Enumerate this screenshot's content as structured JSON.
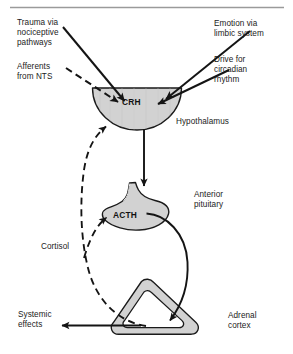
{
  "figure": {
    "type": "biological-pathway-diagram",
    "colors": {
      "organ_fill": "#d2d2d2",
      "organ_stroke": "#1a1a1a",
      "text": "#1b1b1b",
      "rule": "#9a9a9a",
      "background": "#ffffff"
    }
  },
  "rule": {
    "name": "top-divider"
  },
  "labels": {
    "trauma": "Trauma via\nnociceptive\npathways",
    "afferents": "Afferents\nfrom NTS",
    "emotion": "Emotion via\nlimbic system",
    "circadian": "Drive for\ncircadian\nrhythm",
    "hypothalamus": "Hypothalamus",
    "anterior_pituitary": "Anterior\npituitary",
    "cortisol": "Cortisol",
    "systemic_effects": "Systemic\neffects",
    "adrenal_cortex": "Adrenal\ncortex"
  },
  "organs": [
    {
      "id": "hypothalamus",
      "label": "Hypothalamus",
      "hormone": "CRH",
      "shape": "semicircle"
    },
    {
      "id": "anterior-pituitary",
      "label": "Anterior pituitary",
      "hormone": "ACTH",
      "shape": "pituitary-lobe"
    },
    {
      "id": "adrenal-cortex",
      "label": "Adrenal cortex",
      "hormone": "Cortisol",
      "shape": "rounded-triangle-ring"
    }
  ],
  "hormones": {
    "crh": "CRH",
    "acth": "ACTH",
    "cortisol": "Cortisol"
  },
  "arrows": [
    {
      "id": "trauma-to-crh",
      "style": "solid",
      "from": "Trauma via nociceptive pathways",
      "to": "CRH"
    },
    {
      "id": "afferents-to-crh",
      "style": "dashed",
      "from": "Afferents from NTS",
      "to": "CRH"
    },
    {
      "id": "emotion-to-crh",
      "style": "solid",
      "from": "Emotion via limbic system",
      "to": "CRH"
    },
    {
      "id": "circadian-to-crh",
      "style": "solid",
      "from": "Drive for circadian rhythm",
      "to": "CRH"
    },
    {
      "id": "crh-to-acth",
      "style": "solid",
      "from": "CRH",
      "to": "ACTH"
    },
    {
      "id": "acth-to-adrenal",
      "style": "solid",
      "from": "ACTH",
      "to": "Adrenal cortex"
    },
    {
      "id": "cortisol-to-acth",
      "style": "dashed",
      "from": "Adrenal cortex",
      "to": "ACTH"
    },
    {
      "id": "cortisol-to-crh",
      "style": "dashed",
      "from": "Adrenal cortex",
      "to": "CRH"
    },
    {
      "id": "adrenal-to-systemic",
      "style": "solid",
      "from": "Adrenal cortex",
      "to": "Systemic effects"
    }
  ]
}
